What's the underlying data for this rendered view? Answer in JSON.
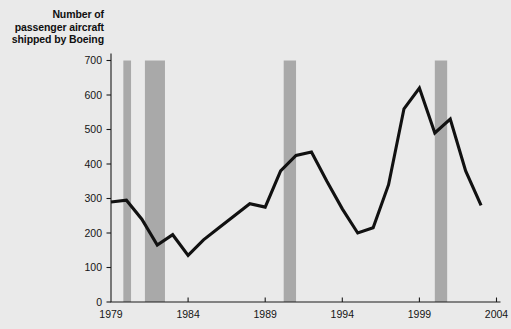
{
  "chart_data": {
    "type": "line",
    "title": "Number of passenger aircraft shipped by Boeing",
    "xlabel": "",
    "ylabel": "",
    "xlim": [
      1979,
      2004
    ],
    "ylim": [
      0,
      700
    ],
    "grid": false,
    "legend": "none",
    "y_ticks": [
      0,
      100,
      200,
      300,
      400,
      500,
      600,
      700
    ],
    "y_tick_labels": [
      "0",
      "100",
      "200",
      "300",
      "400",
      "500",
      "600",
      "700"
    ],
    "x_ticks": [
      1979,
      1984,
      1989,
      1994,
      1999,
      2004
    ],
    "x_tick_labels": [
      "1979",
      "1984",
      "1989",
      "1994",
      "1999",
      "2004"
    ],
    "series": [
      {
        "name": "Passenger aircraft shipped by Boeing",
        "color": "#111111",
        "x": [
          1979,
          1980,
          1981,
          1982,
          1983,
          1984,
          1985,
          1986,
          1987,
          1988,
          1989,
          1990,
          1991,
          1992,
          1993,
          1994,
          1995,
          1996,
          1997,
          1998,
          1999,
          2000,
          2001,
          2002,
          2003
        ],
        "values": [
          290,
          295,
          240,
          165,
          195,
          135,
          180,
          215,
          250,
          285,
          275,
          380,
          425,
          435,
          350,
          270,
          200,
          215,
          340,
          560,
          620,
          490,
          530,
          380,
          280
        ]
      }
    ],
    "shaded_bands": {
      "color": "#a9a9a9",
      "y_top": 700,
      "regions": [
        {
          "start": 1979.8,
          "end": 1980.3
        },
        {
          "start": 1981.2,
          "end": 1982.5
        },
        {
          "start": 1990.2,
          "end": 1991.0
        },
        {
          "start": 2000.0,
          "end": 2000.8
        }
      ]
    }
  }
}
